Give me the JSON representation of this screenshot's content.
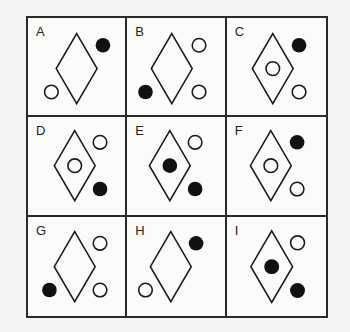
{
  "puzzle": {
    "cells": [
      {
        "label": "A",
        "inner": "none",
        "top_right": "filled",
        "bottom_right": "none",
        "bottom_left": "empty"
      },
      {
        "label": "B",
        "inner": "none",
        "top_right": "empty",
        "bottom_right": "empty",
        "bottom_left": "filled"
      },
      {
        "label": "C",
        "inner": "empty",
        "top_right": "filled",
        "bottom_right": "empty",
        "bottom_left": "none"
      },
      {
        "label": "D",
        "inner": "empty",
        "top_right": "empty",
        "bottom_right": "filled",
        "bottom_left": "none"
      },
      {
        "label": "E",
        "inner": "filled",
        "top_right": "empty",
        "bottom_right": "filled",
        "bottom_left": "none"
      },
      {
        "label": "F",
        "inner": "empty",
        "top_right": "filled",
        "bottom_right": "empty",
        "bottom_left": "none"
      },
      {
        "label": "G",
        "inner": "none",
        "top_right": "empty",
        "bottom_right": "empty",
        "bottom_left": "filled"
      },
      {
        "label": "H",
        "inner": "none",
        "top_right": "filled",
        "bottom_right": "none",
        "bottom_left": "empty"
      },
      {
        "label": "I",
        "inner": "filled",
        "top_right": "empty",
        "bottom_right": "filled",
        "bottom_left": "none"
      }
    ],
    "colors": {
      "stroke": "#1a1a1a",
      "fill": "#111111",
      "background": "#fbfbfa"
    }
  }
}
